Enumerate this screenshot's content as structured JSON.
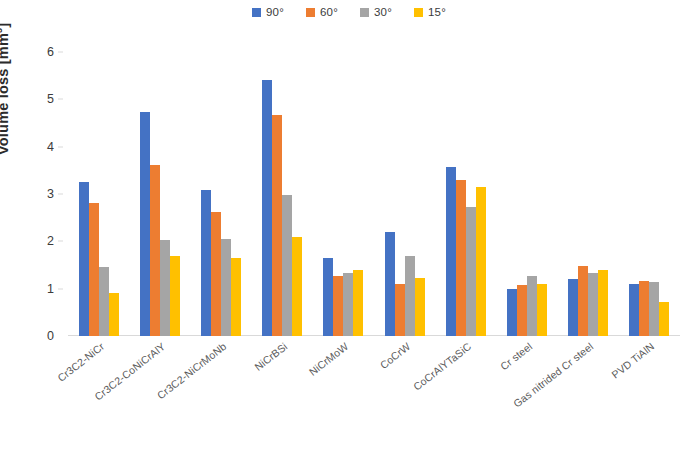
{
  "chart_data": {
    "type": "bar",
    "title": "",
    "xlabel": "",
    "ylabel": "Volume loss [mm³]",
    "ylim": [
      0,
      6
    ],
    "yticks": [
      0,
      1,
      2,
      3,
      4,
      5,
      6
    ],
    "ytick_labels": [
      "0",
      "1",
      "2",
      "3",
      "4",
      "5",
      "6"
    ],
    "grid": false,
    "legend_position": "top-center",
    "categories": [
      "Cr3C2-NiCr",
      "Cr3C2-CoNiCrAlY",
      "Cr3C2-NiCrMoNb",
      "NiCrBSi",
      "NiCrMoW",
      "CoCrW",
      "CoCrAlYTaSiC",
      "Cr steel",
      "Gas nitrided Cr steel",
      "PVD TiAlN"
    ],
    "series": [
      {
        "name": "90°",
        "color": "#4472C4",
        "values": [
          3.25,
          4.74,
          3.09,
          5.41,
          1.65,
          2.2,
          3.57,
          0.99,
          1.21,
          1.1
        ]
      },
      {
        "name": "60°",
        "color": "#ED7D31",
        "values": [
          2.82,
          3.62,
          2.62,
          4.67,
          1.27,
          1.1,
          3.3,
          1.07,
          1.48,
          1.16
        ]
      },
      {
        "name": "30°",
        "color": "#A5A5A5",
        "values": [
          1.45,
          2.02,
          2.05,
          2.98,
          1.34,
          1.68,
          2.72,
          1.27,
          1.33,
          1.14
        ]
      },
      {
        "name": "15°",
        "color": "#FFC000",
        "values": [
          0.9,
          1.69,
          1.65,
          2.09,
          1.4,
          1.23,
          3.15,
          1.1,
          1.39,
          0.72
        ]
      }
    ]
  }
}
